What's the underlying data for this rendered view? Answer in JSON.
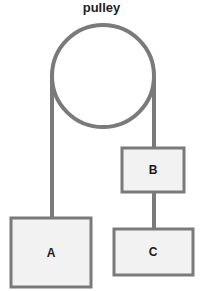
{
  "title": "pulley",
  "colors": {
    "stroke": "#7a7a7a",
    "box_fill": "#f2f2f2",
    "label": "#1a1a1a",
    "background": "#ffffff"
  },
  "pulley": {
    "cx": 103,
    "cy": 76,
    "r": 51
  },
  "boxes": [
    {
      "id": "A",
      "label": "A",
      "x": 11,
      "y": 218,
      "w": 80,
      "h": 69
    },
    {
      "id": "B",
      "label": "B",
      "x": 122,
      "y": 148,
      "w": 62,
      "h": 44
    },
    {
      "id": "C",
      "label": "C",
      "x": 114,
      "y": 229,
      "w": 79,
      "h": 46
    }
  ],
  "ropes": [
    {
      "name": "rope-left-to-A",
      "x1": 52,
      "y1": 76,
      "x2": 52,
      "y2": 218
    },
    {
      "name": "rope-right-to-B",
      "x1": 154,
      "y1": 76,
      "x2": 154,
      "y2": 148
    },
    {
      "name": "rope-B-to-C",
      "x1": 154,
      "y1": 192,
      "x2": 154,
      "y2": 229
    }
  ]
}
